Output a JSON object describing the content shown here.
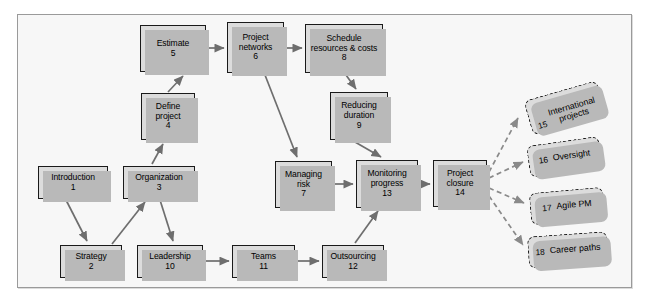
{
  "diagram": {
    "colors": {
      "box_fill": "#dcdcdc",
      "box_border": "#1a1a1a",
      "shadow": "#b9b9b9",
      "frame_bg": "#f7f7f7",
      "frame_border": "#9a9a9a",
      "connector": "#6e6e6e",
      "dashed_connector": "#8a8a8a"
    },
    "nodes": [
      {
        "id": "n1",
        "label": "Introduction",
        "num": "1",
        "x": 38,
        "y": 166,
        "w": 70,
        "h": 33,
        "kind": "solid"
      },
      {
        "id": "n2",
        "label": "Strategy",
        "num": "2",
        "x": 60,
        "y": 245,
        "w": 62,
        "h": 33,
        "kind": "solid"
      },
      {
        "id": "n3",
        "label": "Organization",
        "num": "3",
        "x": 123,
        "y": 166,
        "w": 72,
        "h": 33,
        "kind": "solid"
      },
      {
        "id": "n4",
        "label": "Define\nproject",
        "num": "4",
        "x": 141,
        "y": 93,
        "w": 54,
        "h": 47,
        "kind": "solid"
      },
      {
        "id": "n5",
        "label": "Estimate",
        "num": "5",
        "x": 140,
        "y": 25,
        "w": 66,
        "h": 47,
        "kind": "solid"
      },
      {
        "id": "n6",
        "label": "Project\nnetworks",
        "num": "6",
        "x": 227,
        "y": 22,
        "w": 57,
        "h": 51,
        "kind": "solid"
      },
      {
        "id": "n7",
        "label": "Managing\nrisk",
        "num": "7",
        "x": 275,
        "y": 161,
        "w": 57,
        "h": 47,
        "kind": "solid"
      },
      {
        "id": "n8",
        "label": "Schedule\nresources & costs",
        "num": "8",
        "x": 305,
        "y": 24,
        "w": 78,
        "h": 49,
        "kind": "solid"
      },
      {
        "id": "n9",
        "label": "Reducing\nduration",
        "num": "9",
        "x": 330,
        "y": 92,
        "w": 58,
        "h": 48,
        "kind": "solid"
      },
      {
        "id": "n10",
        "label": "Leadership",
        "num": "10",
        "x": 137,
        "y": 245,
        "w": 66,
        "h": 33,
        "kind": "solid"
      },
      {
        "id": "n11",
        "label": "Teams",
        "num": "11",
        "x": 232,
        "y": 245,
        "w": 63,
        "h": 33,
        "kind": "solid"
      },
      {
        "id": "n12",
        "label": "Outsourcing",
        "num": "12",
        "x": 322,
        "y": 245,
        "w": 62,
        "h": 33,
        "kind": "solid"
      },
      {
        "id": "n13",
        "label": "Monitoring\nprogress",
        "num": "13",
        "x": 356,
        "y": 160,
        "w": 62,
        "h": 48,
        "kind": "solid"
      },
      {
        "id": "n14",
        "label": "Project\nclosure",
        "num": "14",
        "x": 433,
        "y": 160,
        "w": 54,
        "h": 47,
        "kind": "solid"
      },
      {
        "id": "n15",
        "label": "International\nprojects",
        "num": "15",
        "x": 527,
        "y": 90,
        "w": 76,
        "h": 36,
        "kind": "dashed",
        "rotate": -16
      },
      {
        "id": "n16",
        "label": "Oversight",
        "num": "16",
        "x": 528,
        "y": 141,
        "w": 73,
        "h": 32,
        "kind": "dashed",
        "rotate": -8
      },
      {
        "id": "n17",
        "label": "Agile PM",
        "num": "17",
        "x": 530,
        "y": 190,
        "w": 74,
        "h": 32,
        "kind": "dashed",
        "rotate": -5
      },
      {
        "id": "n18",
        "label": "Career paths",
        "num": "18",
        "x": 528,
        "y": 234,
        "w": 80,
        "h": 32,
        "kind": "dashed",
        "rotate": -4
      }
    ],
    "connectors": [
      {
        "from": "n5",
        "to": "n6",
        "style": "solid"
      },
      {
        "from": "n6",
        "to": "n8",
        "style": "solid"
      },
      {
        "from": "n4",
        "to": "n5",
        "style": "solid"
      },
      {
        "from": "n3",
        "to": "n4",
        "style": "solid"
      },
      {
        "from": "n1",
        "to": "n2",
        "style": "solid"
      },
      {
        "from": "n2",
        "to": "n3",
        "style": "solid"
      },
      {
        "from": "n3",
        "to": "n10",
        "style": "solid"
      },
      {
        "from": "n10",
        "to": "n11",
        "style": "solid"
      },
      {
        "from": "n11",
        "to": "n12",
        "style": "solid"
      },
      {
        "from": "n12",
        "to": "n13",
        "style": "solid"
      },
      {
        "from": "n8",
        "to": "n9",
        "style": "solid"
      },
      {
        "from": "n9",
        "to": "n13",
        "style": "solid"
      },
      {
        "from": "n6",
        "to": "n7",
        "style": "solid"
      },
      {
        "from": "n7",
        "to": "n13",
        "style": "solid"
      },
      {
        "from": "n13",
        "to": "n14",
        "style": "solid"
      },
      {
        "from": "n14",
        "to": "n15",
        "style": "dashed"
      },
      {
        "from": "n14",
        "to": "n16",
        "style": "dashed"
      },
      {
        "from": "n14",
        "to": "n17",
        "style": "dashed"
      },
      {
        "from": "n14",
        "to": "n18",
        "style": "dashed"
      }
    ]
  }
}
